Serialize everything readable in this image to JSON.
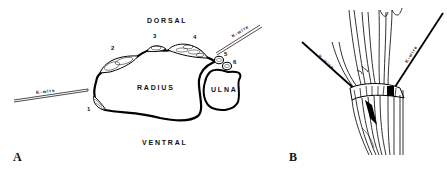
{
  "figure": {
    "panel_a": {
      "letter": "A",
      "orientation": {
        "top": "DORSAL",
        "bottom": "VENTRAL"
      },
      "bones": {
        "radius": "RADIUS",
        "ulna": "ULNA"
      },
      "compartments": [
        "1",
        "2",
        "3",
        "4",
        "5",
        "6"
      ],
      "wires": [
        {
          "label": "K-wire",
          "side": "left"
        },
        {
          "label": "K-wire",
          "side": "right"
        }
      ]
    },
    "panel_b": {
      "letter": "B",
      "wires": [
        {
          "label": "K-wire",
          "side": "left"
        },
        {
          "label": "K-wire",
          "side": "right"
        }
      ]
    }
  }
}
